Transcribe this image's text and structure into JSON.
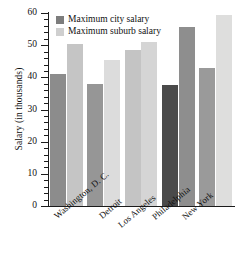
{
  "chart_data": {
    "type": "bar",
    "title": "",
    "xlabel": "",
    "ylabel": "Salary (in thousands)",
    "ylim": [
      0,
      60
    ],
    "ytick_labels": [
      "0",
      "10",
      "20",
      "30",
      "40",
      "50",
      "60"
    ],
    "ytick_values": [
      0,
      10,
      20,
      30,
      40,
      50,
      60
    ],
    "minor_tick_step": 2,
    "grid": false,
    "legend_position": "top-left",
    "categories": [
      "Washington, D. C.",
      "Detroit",
      "Los Angeles",
      "Philadelphia",
      "New York"
    ],
    "series": [
      {
        "name": "Maximum city salary",
        "color": "#8b8b8b",
        "values": [
          41,
          38,
          48.5,
          37.5,
          43
        ]
      },
      {
        "name": "Maximum suburb salary",
        "color": "#d2d2d2",
        "values": [
          50.5,
          45.5,
          51,
          55.5,
          59.5
        ]
      }
    ],
    "bar_colors": {
      "city": [
        "#8c8c8c",
        "#969696",
        "#c4c4c4",
        "#4a4a4a",
        "#9a9a9a"
      ],
      "suburb": [
        "#c5c5c5",
        "#dcdcdc",
        "#d5d5d5",
        "#8e8e8e",
        "#dededd"
      ]
    }
  },
  "legend": {
    "items": [
      {
        "label": "Maximum city salary",
        "swatch_color": "#7d7d7d"
      },
      {
        "label": "Maximum suburb salary",
        "swatch_color": "#cfcfcf"
      }
    ]
  },
  "axis": {
    "y_title": "Salary (in thousands)",
    "axis_color": "#1b1b1b"
  }
}
